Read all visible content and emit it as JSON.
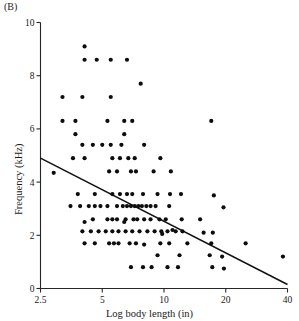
{
  "figure": {
    "panel_label": "(B)"
  },
  "chart_data": {
    "type": "scatter",
    "title": "",
    "xlabel": "Log body length (in)",
    "ylabel": "Frequency (kHz)",
    "xscale": "log",
    "yscale": "linear",
    "xlim": [
      2.5,
      40
    ],
    "ylim": [
      0,
      10
    ],
    "xticks": [
      2.5,
      5,
      10,
      20,
      40
    ],
    "xticklabels": [
      "2.5",
      "5",
      "10",
      "20",
      "40"
    ],
    "yticks": [
      0,
      2,
      4,
      6,
      8,
      10
    ],
    "yticklabels": [
      "0",
      "2",
      "4",
      "6",
      "8",
      "10"
    ],
    "grid": false,
    "legend": null,
    "marker": "filled-circle",
    "marker_color": "#0d0d0d",
    "marker_size_px": 3.0,
    "trendline": {
      "label": "regression-line",
      "color": "#111111",
      "x_start": 2.5,
      "y_start": 4.9,
      "x_end": 40,
      "y_end": 0.15
    },
    "points": [
      [
        4.1,
        9.1
      ],
      [
        4.1,
        8.6
      ],
      [
        4.7,
        8.6
      ],
      [
        5.5,
        8.6
      ],
      [
        6.6,
        8.6
      ],
      [
        7.7,
        7.7
      ],
      [
        3.2,
        7.2
      ],
      [
        4.0,
        7.2
      ],
      [
        5.5,
        7.2
      ],
      [
        3.2,
        6.3
      ],
      [
        3.7,
        6.3
      ],
      [
        5.3,
        6.3
      ],
      [
        6.4,
        6.3
      ],
      [
        7.0,
        6.3
      ],
      [
        17.0,
        6.3
      ],
      [
        3.7,
        5.8
      ],
      [
        6.4,
        5.8
      ],
      [
        4.0,
        5.4
      ],
      [
        4.5,
        5.4
      ],
      [
        5.0,
        5.4
      ],
      [
        5.5,
        5.4
      ],
      [
        6.2,
        5.4
      ],
      [
        8.0,
        5.4
      ],
      [
        3.6,
        4.9
      ],
      [
        4.1,
        4.9
      ],
      [
        5.6,
        4.9
      ],
      [
        6.1,
        4.9
      ],
      [
        6.7,
        4.9
      ],
      [
        7.2,
        4.9
      ],
      [
        9.6,
        4.9
      ],
      [
        5.4,
        4.4
      ],
      [
        5.9,
        4.4
      ],
      [
        6.9,
        4.4
      ],
      [
        7.3,
        4.4
      ],
      [
        8.9,
        4.4
      ],
      [
        10.8,
        4.4
      ],
      [
        2.9,
        4.35
      ],
      [
        3.8,
        3.55
      ],
      [
        4.6,
        3.55
      ],
      [
        5.6,
        3.55
      ],
      [
        6.1,
        3.55
      ],
      [
        6.6,
        3.55
      ],
      [
        7.0,
        3.55
      ],
      [
        7.9,
        3.55
      ],
      [
        9.3,
        3.55
      ],
      [
        10.7,
        3.55
      ],
      [
        12.1,
        3.55
      ],
      [
        17.5,
        3.5
      ],
      [
        3.5,
        3.1
      ],
      [
        3.9,
        3.1
      ],
      [
        4.3,
        3.1
      ],
      [
        4.6,
        3.1
      ],
      [
        4.9,
        3.1
      ],
      [
        5.3,
        3.1
      ],
      [
        5.9,
        3.1
      ],
      [
        6.3,
        3.1
      ],
      [
        6.6,
        3.1
      ],
      [
        6.9,
        3.1
      ],
      [
        7.2,
        3.1
      ],
      [
        7.5,
        3.1
      ],
      [
        7.8,
        3.1
      ],
      [
        8.2,
        3.1
      ],
      [
        8.6,
        3.1
      ],
      [
        9.1,
        3.1
      ],
      [
        10.6,
        3.1
      ],
      [
        19.5,
        3.05
      ],
      [
        4.5,
        2.6
      ],
      [
        5.3,
        2.6
      ],
      [
        5.6,
        2.6
      ],
      [
        5.9,
        2.6
      ],
      [
        6.5,
        2.6
      ],
      [
        7.1,
        2.6
      ],
      [
        7.4,
        2.6
      ],
      [
        8.0,
        2.6
      ],
      [
        8.6,
        2.6
      ],
      [
        9.5,
        2.6
      ],
      [
        10.2,
        2.6
      ],
      [
        12.2,
        2.6
      ],
      [
        15.0,
        2.6
      ],
      [
        4.1,
        2.5
      ],
      [
        6.4,
        2.5
      ],
      [
        4.0,
        2.15
      ],
      [
        4.4,
        2.15
      ],
      [
        4.8,
        2.15
      ],
      [
        5.2,
        2.15
      ],
      [
        5.6,
        2.15
      ],
      [
        6.0,
        2.15
      ],
      [
        6.5,
        2.15
      ],
      [
        7.0,
        2.15
      ],
      [
        7.6,
        2.15
      ],
      [
        8.3,
        2.15
      ],
      [
        9.0,
        2.15
      ],
      [
        9.7,
        2.15
      ],
      [
        10.4,
        2.15
      ],
      [
        11.4,
        2.15
      ],
      [
        12.3,
        2.15
      ],
      [
        15.6,
        2.1
      ],
      [
        17.3,
        2.1
      ],
      [
        9.8,
        2.05
      ],
      [
        11.0,
        2.2
      ],
      [
        4.1,
        1.7
      ],
      [
        4.6,
        1.7
      ],
      [
        5.4,
        1.7
      ],
      [
        5.7,
        1.7
      ],
      [
        6.0,
        1.7
      ],
      [
        6.8,
        1.7
      ],
      [
        7.3,
        1.7
      ],
      [
        8.0,
        1.65
      ],
      [
        9.6,
        1.7
      ],
      [
        10.6,
        1.7
      ],
      [
        13.0,
        1.7
      ],
      [
        17.0,
        1.7
      ],
      [
        25.0,
        1.7
      ],
      [
        9.3,
        1.25
      ],
      [
        11.9,
        1.25
      ],
      [
        16.7,
        1.25
      ],
      [
        19.2,
        1.2
      ],
      [
        38.0,
        1.2
      ],
      [
        6.9,
        0.8
      ],
      [
        7.9,
        0.8
      ],
      [
        8.7,
        0.8
      ],
      [
        10.4,
        0.8
      ],
      [
        11.7,
        0.8
      ],
      [
        17.2,
        0.8
      ],
      [
        19.6,
        0.75
      ]
    ]
  }
}
